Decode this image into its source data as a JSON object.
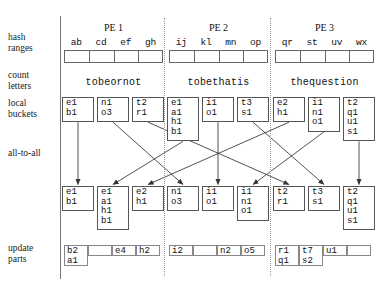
{
  "row_labels": [
    {
      "id": "hash-ranges",
      "lines": [
        "hash",
        "ranges"
      ],
      "top": 32
    },
    {
      "id": "count-letters",
      "lines": [
        "count",
        "letters"
      ],
      "top": 70
    },
    {
      "id": "local-buckets",
      "lines": [
        "local",
        "buckets"
      ],
      "top": 98
    },
    {
      "id": "all-to-all",
      "lines": [
        "all-to-all"
      ],
      "top": 148
    },
    {
      "id": "update-parts",
      "lines": [
        "update",
        "parts"
      ],
      "top": 243
    }
  ],
  "pes": [
    {
      "title": "PE 1",
      "hash_ranges": [
        "ab",
        "cd",
        "ef",
        "gh"
      ],
      "count_letters_word": "tobeornot",
      "local_buckets": [
        [
          "e1",
          "b1"
        ],
        [
          "n1",
          "o3"
        ],
        [
          "t2",
          "r1"
        ]
      ],
      "received_buckets": [
        [
          "e1",
          "b1"
        ],
        [
          "e1",
          "a1",
          "h1",
          "b1"
        ],
        [
          "e2",
          "h1"
        ]
      ],
      "update_parts": [
        [
          "b2",
          "a1"
        ],
        [],
        [
          "e4"
        ],
        [
          "h2"
        ]
      ]
    },
    {
      "title": "PE 2",
      "hash_ranges": [
        "ij",
        "kl",
        "mn",
        "op"
      ],
      "count_letters_word": "tobethatis",
      "local_buckets": [
        [
          "e1",
          "a1",
          "h1",
          "b1"
        ],
        [
          "i1",
          "o1"
        ],
        [
          "t3",
          "s1"
        ]
      ],
      "received_buckets": [
        [
          "n1",
          "o3"
        ],
        [
          "i1",
          "o1"
        ],
        [
          "i1",
          "n1",
          "o1"
        ]
      ],
      "update_parts": [
        [
          "i2"
        ],
        [],
        [
          "n2"
        ],
        [
          "o5"
        ]
      ]
    },
    {
      "title": "PE 3",
      "hash_ranges": [
        "qr",
        "st",
        "uv",
        "wx"
      ],
      "count_letters_word": "thequestion",
      "local_buckets": [
        [
          "e2",
          "h1"
        ],
        [
          "i1",
          "n1",
          "o1"
        ],
        [
          "t2",
          "q1",
          "u1",
          "s1"
        ]
      ],
      "received_buckets": [
        [
          "t2",
          "r1"
        ],
        [
          "t3",
          "s1"
        ],
        [
          "t2",
          "q1",
          "u1",
          "s1"
        ]
      ],
      "update_parts": [
        [
          "r1",
          "q1"
        ],
        [
          "t7",
          "s2"
        ],
        [
          "u1"
        ],
        []
      ]
    }
  ],
  "exchange_routes": [
    {
      "from_pe": 0,
      "from_bucket": 0,
      "to_pe": 0,
      "to_slot": 0
    },
    {
      "from_pe": 0,
      "from_bucket": 1,
      "to_pe": 1,
      "to_slot": 0
    },
    {
      "from_pe": 0,
      "from_bucket": 2,
      "to_pe": 2,
      "to_slot": 0
    },
    {
      "from_pe": 1,
      "from_bucket": 0,
      "to_pe": 0,
      "to_slot": 1
    },
    {
      "from_pe": 1,
      "from_bucket": 1,
      "to_pe": 1,
      "to_slot": 1
    },
    {
      "from_pe": 1,
      "from_bucket": 2,
      "to_pe": 2,
      "to_slot": 1
    },
    {
      "from_pe": 2,
      "from_bucket": 0,
      "to_pe": 0,
      "to_slot": 2
    },
    {
      "from_pe": 2,
      "from_bucket": 1,
      "to_pe": 1,
      "to_slot": 2
    },
    {
      "from_pe": 2,
      "from_bucket": 2,
      "to_pe": 2,
      "to_slot": 2
    }
  ],
  "colors": {
    "ink": "#111111",
    "box_border": "#555555",
    "strip_border": "#666666",
    "rule": "#777777",
    "dotted_rule": "#999999",
    "background": "#ffffff"
  }
}
